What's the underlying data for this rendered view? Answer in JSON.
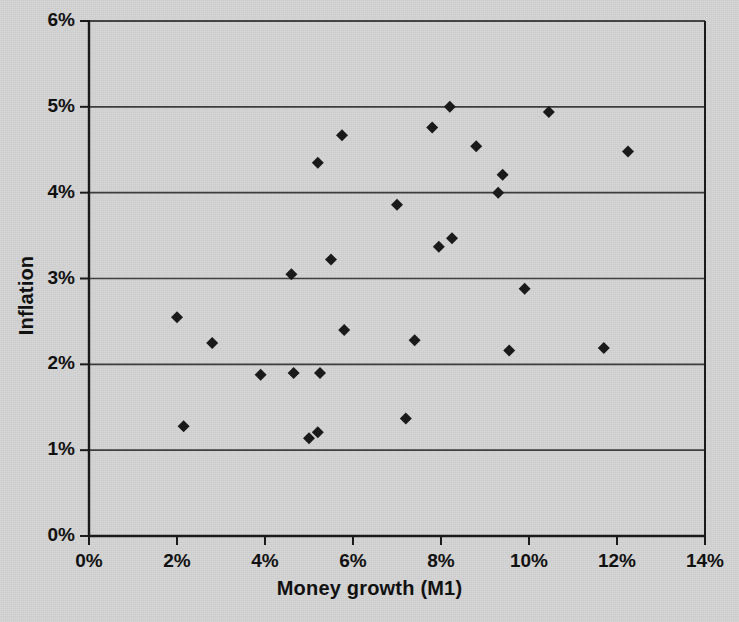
{
  "chart_data": {
    "type": "scatter",
    "title": "",
    "xlabel": "Money growth (M1)",
    "ylabel": "Inflation",
    "xlim": [
      0,
      14
    ],
    "ylim": [
      0,
      6
    ],
    "xticks": [
      0,
      2,
      4,
      6,
      8,
      10,
      12,
      14
    ],
    "xtick_labels": [
      "0%",
      "2%",
      "4%",
      "6%",
      "8%",
      "10%",
      "12%",
      "14%"
    ],
    "yticks": [
      0,
      1,
      2,
      3,
      4,
      5,
      6
    ],
    "ytick_labels": [
      "0%",
      "1%",
      "2%",
      "3%",
      "4%",
      "5%",
      "6%"
    ],
    "grid": "horizontal",
    "legend": "none",
    "marker": "diamond",
    "marker_color": "#1a1a1a",
    "marker_size": 11,
    "points": [
      {
        "x": 2.0,
        "y": 2.55
      },
      {
        "x": 2.15,
        "y": 1.28
      },
      {
        "x": 2.8,
        "y": 2.25
      },
      {
        "x": 3.9,
        "y": 1.88
      },
      {
        "x": 4.6,
        "y": 3.05
      },
      {
        "x": 4.65,
        "y": 1.9
      },
      {
        "x": 5.0,
        "y": 1.14
      },
      {
        "x": 5.2,
        "y": 1.21
      },
      {
        "x": 5.25,
        "y": 1.9
      },
      {
        "x": 5.2,
        "y": 4.35
      },
      {
        "x": 5.5,
        "y": 3.22
      },
      {
        "x": 5.75,
        "y": 4.67
      },
      {
        "x": 5.8,
        "y": 2.4
      },
      {
        "x": 7.0,
        "y": 3.86
      },
      {
        "x": 7.2,
        "y": 1.37
      },
      {
        "x": 7.4,
        "y": 2.28
      },
      {
        "x": 7.8,
        "y": 4.76
      },
      {
        "x": 7.95,
        "y": 3.37
      },
      {
        "x": 8.2,
        "y": 5.0
      },
      {
        "x": 8.25,
        "y": 3.47
      },
      {
        "x": 8.8,
        "y": 4.54
      },
      {
        "x": 9.3,
        "y": 4.0
      },
      {
        "x": 9.4,
        "y": 4.21
      },
      {
        "x": 9.55,
        "y": 2.16
      },
      {
        "x": 9.9,
        "y": 2.88
      },
      {
        "x": 10.45,
        "y": 4.94
      },
      {
        "x": 11.7,
        "y": 2.19
      },
      {
        "x": 12.25,
        "y": 4.48
      }
    ]
  },
  "style": {
    "background": "#d4d4d4",
    "gridline_color": "#3c3c3c",
    "axis_color": "#1a1a1a",
    "text_color": "#111111"
  },
  "geometry": {
    "plot_left": 89,
    "plot_right": 705,
    "plot_top": 21,
    "plot_bottom": 536
  }
}
